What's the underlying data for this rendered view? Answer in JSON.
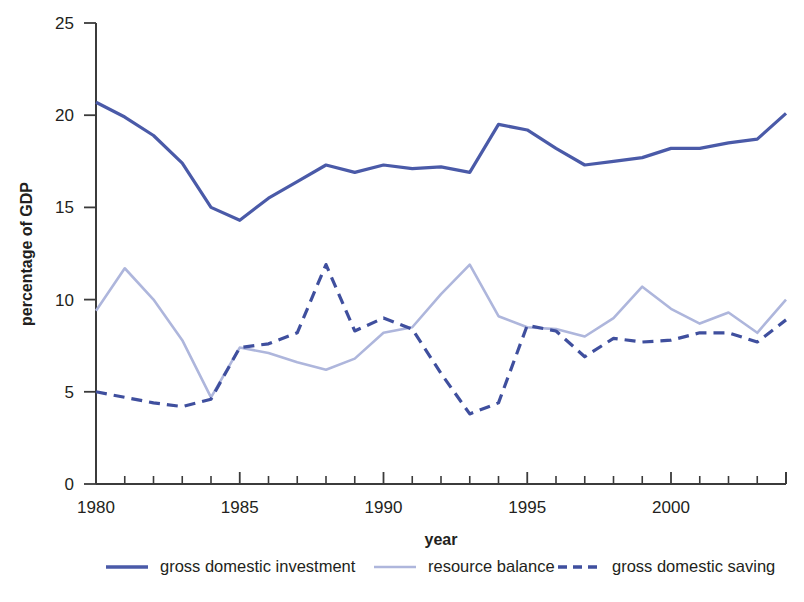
{
  "chart_data": {
    "type": "line",
    "title": "",
    "xlabel": "year",
    "ylabel": "percentage of GDP",
    "xlim": [
      1980,
      2004
    ],
    "ylim": [
      0,
      25
    ],
    "grid": false,
    "legend_position": "bottom",
    "x": [
      1980,
      1981,
      1982,
      1983,
      1984,
      1985,
      1986,
      1987,
      1988,
      1989,
      1990,
      1991,
      1992,
      1993,
      1994,
      1995,
      1996,
      1997,
      1998,
      1999,
      2000,
      2001,
      2002,
      2003,
      2004
    ],
    "xticks": [
      1980,
      1985,
      1990,
      1995,
      2000
    ],
    "xtick_labels": [
      "1980",
      "1985",
      "1990",
      "1995",
      "2000"
    ],
    "yticks": [
      0,
      5,
      10,
      15,
      20,
      25
    ],
    "ytick_labels": [
      "0",
      "5",
      "10",
      "15",
      "20",
      "25"
    ],
    "series": [
      {
        "name": "gross domestic investment",
        "style": "solid",
        "color": "#4a5aa8",
        "width": 3.2,
        "values": [
          20.7,
          19.9,
          18.9,
          17.4,
          15.0,
          14.3,
          15.5,
          16.4,
          17.3,
          16.9,
          17.3,
          17.1,
          17.2,
          16.9,
          19.5,
          19.2,
          18.2,
          17.3,
          17.5,
          17.7,
          18.2,
          18.2,
          18.5,
          18.7,
          20.1
        ]
      },
      {
        "name": "resource balance",
        "style": "solid",
        "color": "#aeb6dc",
        "width": 2.6,
        "values": [
          9.4,
          11.7,
          10.0,
          7.8,
          4.7,
          7.4,
          7.1,
          6.6,
          6.2,
          6.8,
          8.2,
          8.5,
          10.3,
          11.9,
          9.1,
          8.5,
          8.4,
          8.0,
          9.0,
          10.7,
          9.5,
          8.7,
          9.3,
          8.2,
          10.0
        ]
      },
      {
        "name": "gross domestic saving",
        "style": "dashed",
        "color": "#3f4f9e",
        "width": 3.2,
        "values": [
          5.0,
          4.7,
          4.4,
          4.2,
          4.6,
          7.4,
          7.6,
          8.2,
          11.9,
          8.3,
          9.0,
          8.4,
          6.0,
          3.8,
          4.4,
          8.6,
          8.3,
          6.9,
          7.9,
          7.7,
          7.8,
          8.2,
          8.2,
          7.7,
          8.9
        ]
      }
    ]
  },
  "axes": {
    "x_title": "year",
    "y_title": "percentage of GDP"
  },
  "legend": {
    "items": [
      {
        "label": "gross domestic investment",
        "style": "solid",
        "color": "#4a5aa8"
      },
      {
        "label": "resource balance",
        "style": "solid",
        "color": "#aeb6dc"
      },
      {
        "label": "gross domestic saving",
        "style": "dashed",
        "color": "#3f4f9e"
      }
    ]
  }
}
